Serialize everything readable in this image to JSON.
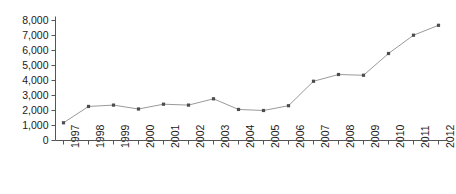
{
  "chart_data": {
    "type": "line",
    "title": "",
    "xlabel": "",
    "ylabel": "",
    "categories": [
      "1997",
      "1998",
      "1999",
      "2000",
      "2001",
      "2002",
      "2003",
      "2004",
      "2005",
      "2006",
      "2007",
      "2008",
      "2009",
      "2010",
      "2011",
      "2012"
    ],
    "values": [
      1180,
      2270,
      2360,
      2100,
      2420,
      2360,
      2780,
      2070,
      2000,
      2320,
      3950,
      4400,
      4350,
      5800,
      7020,
      7680
    ],
    "ylim": [
      0,
      8000
    ],
    "ytick_labels": [
      "8,000",
      "7,000",
      "6,000",
      "5,000",
      "4,000",
      "3,000",
      "2,000",
      "1,000",
      "0"
    ],
    "ytick_values": [
      8000,
      7000,
      6000,
      5000,
      4000,
      3000,
      2000,
      1000,
      0
    ],
    "grid": false,
    "legend": "none",
    "series_color": "#9a9a9a",
    "marker_color": "#4d4d4d",
    "axis_color": "#555555",
    "text_color": "#1a1a1a"
  }
}
